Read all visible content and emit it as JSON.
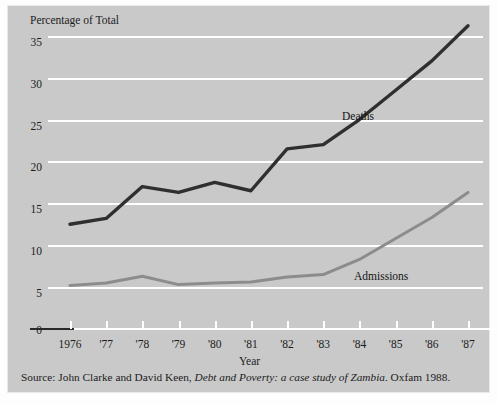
{
  "figure": {
    "y_axis_title": "Percentage of Total",
    "x_axis_title": "Year",
    "source_prefix": "Source: John Clarke and David Keen,",
    "source_italic": "Debt and Poverty: a case study of Zambia",
    "source_suffix": ". Oxfam 1988.",
    "colors": {
      "background": "#c9c9c9",
      "gridline": "#ffffff",
      "deaths": "#2f2f2f",
      "admissions": "#8c8c8c",
      "text": "#1c1c1c"
    }
  },
  "chart_data": {
    "type": "line",
    "title": "",
    "subtitle": "",
    "xlabel": "Year",
    "ylabel": "Percentage of Total",
    "grid": true,
    "legend_position": "inline-annotation",
    "x": [
      1976,
      1977,
      1978,
      1979,
      1980,
      1981,
      1982,
      1983,
      1984,
      1985,
      1986,
      1987
    ],
    "categories": [
      "1976",
      "'77",
      "'78",
      "'79",
      "'80",
      "'81",
      "'82",
      "'83",
      "'84",
      "'85",
      "'86",
      "'87"
    ],
    "ylim": [
      0,
      37
    ],
    "yticks": [
      0,
      5,
      10,
      15,
      20,
      25,
      30,
      35
    ],
    "ytick_labels": [
      "0",
      "5",
      "10",
      "15",
      "20",
      "25",
      "30",
      "35"
    ],
    "series": [
      {
        "name": "Deaths",
        "color": "#2f2f2f",
        "values": [
          12.5,
          13.2,
          17.0,
          16.3,
          17.5,
          16.5,
          21.5,
          22.0,
          25.0,
          28.5,
          32.0,
          36.2
        ]
      },
      {
        "name": "Admissions",
        "color": "#8c8c8c",
        "values": [
          5.2,
          5.5,
          6.3,
          5.3,
          5.5,
          5.6,
          6.2,
          6.5,
          8.3,
          10.8,
          13.3,
          16.3
        ]
      }
    ],
    "annotations": [
      {
        "text": "Deaths",
        "x": 1984,
        "y": 26.5
      },
      {
        "text": "Admissions",
        "x": 1984.3,
        "y": 8.6
      }
    ]
  }
}
